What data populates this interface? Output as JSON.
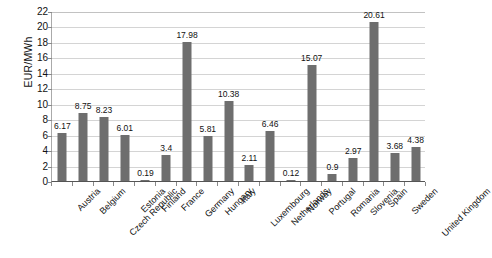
{
  "chart_data": {
    "type": "bar",
    "title": "",
    "subtitle": "",
    "xlabel": "",
    "ylabel": "EUR/MWh",
    "ylim": [
      0,
      22
    ],
    "ytick_step": 2,
    "yticks": [
      0,
      2,
      4,
      6,
      8,
      10,
      12,
      14,
      16,
      18,
      20,
      22
    ],
    "grid": true,
    "legend": false,
    "legend_position": "none",
    "bar_color": "#6e6e6e",
    "gridline_color": "#d4d4d4",
    "axis_color": "#555555",
    "categories": [
      "Austria",
      "Belgium",
      "Czech Republic",
      "Estonia",
      "Finland",
      "France",
      "Germany",
      "Hungary",
      "Italy",
      "Luxembourg",
      "Netherlands",
      "Norway",
      "Portugal",
      "Romania",
      "Slovenia",
      "Spain",
      "Sweden",
      "United Kingdom"
    ],
    "values": [
      6.17,
      8.75,
      8.23,
      6.01,
      0.19,
      3.4,
      17.98,
      5.81,
      10.38,
      2.11,
      6.46,
      0.12,
      15.07,
      0.9,
      2.97,
      20.61,
      3.68,
      4.38
    ],
    "value_labels": [
      "6.17",
      "8.75",
      "8.23",
      "6.01",
      "0.19",
      "3.4",
      "17.98",
      "5.81",
      "10.38",
      "2.11",
      "6.46",
      "0.12",
      "15.07",
      "0.9",
      "2.97",
      "20.61",
      "3.68",
      "4.38"
    ]
  }
}
